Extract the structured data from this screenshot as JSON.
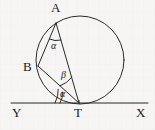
{
  "figure": {
    "background_color": "#f6f5f3",
    "stroke_color": "#2a2a2a",
    "labels": {
      "point_a": "A",
      "point_b": "B",
      "point_t": "T",
      "line_left": "Y",
      "line_right": "X",
      "angle_at_a": "α",
      "angle_at_t_inner": "β",
      "angle_at_t_tangent": "α"
    }
  },
  "geometry": {
    "circle": {
      "cx": 80,
      "cy": 60,
      "r": 44
    },
    "points": {
      "A": {
        "x": 56,
        "y": 23
      },
      "B": {
        "x": 38,
        "y": 66
      },
      "T": {
        "x": 79,
        "y": 103
      }
    },
    "tangent_line": {
      "x1": 11,
      "y1": 103,
      "x2": 148,
      "y2": 103
    },
    "segments": [
      {
        "name": "AB",
        "from": "A",
        "to": "B"
      },
      {
        "name": "BT",
        "from": "B",
        "to": "T"
      },
      {
        "name": "AT",
        "from": "A",
        "to": "T"
      }
    ],
    "angle_marks": [
      {
        "name": "alpha-at-A",
        "vertex": "A",
        "symbol": "α"
      },
      {
        "name": "beta-at-T",
        "vertex": "T",
        "symbol": "β"
      },
      {
        "name": "alpha-at-T",
        "vertex": "T",
        "symbol": "α"
      }
    ]
  }
}
